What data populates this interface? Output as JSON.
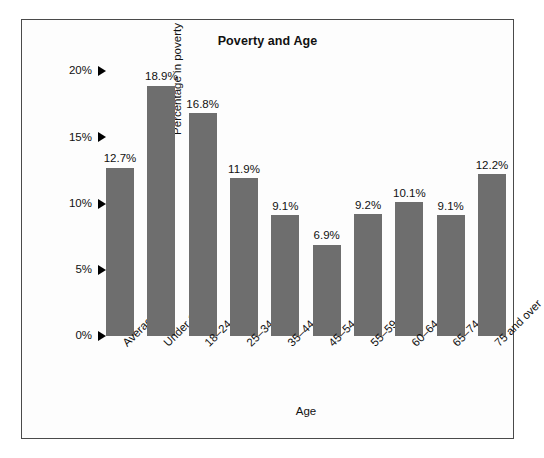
{
  "figure": {
    "title": "Poverty and Age",
    "bar_color": "#6e6e6e",
    "frame_color": "#4a4a4a",
    "background": "#fdfdfd"
  },
  "axes": {
    "x_title": "Age",
    "y_title": "Percentage in poverty",
    "y_ticks": [
      "20%",
      "15%",
      "10%",
      "5%",
      "0%"
    ],
    "y_tick_values": [
      20,
      15,
      10,
      5,
      0
    ],
    "tick_marker": "right-triangle"
  },
  "chart_data": {
    "type": "bar",
    "title": "Poverty and Age",
    "xlabel": "Age",
    "ylabel": "Percentage in poverty",
    "ylim": [
      0,
      20
    ],
    "yticks": [
      0,
      5,
      10,
      15,
      20
    ],
    "ytick_labels": [
      "0%",
      "5%",
      "10%",
      "15%",
      "20%"
    ],
    "grid": false,
    "legend": false,
    "categories": [
      "Average",
      "Under 18",
      "18–24",
      "25–34",
      "35–44",
      "45–54",
      "55–59",
      "60–64",
      "65–74",
      "75 and over"
    ],
    "values": [
      12.7,
      18.9,
      16.8,
      11.9,
      9.1,
      6.9,
      9.2,
      10.1,
      9.1,
      12.2
    ],
    "data_labels": [
      "12.7%",
      "18.9%",
      "16.8%",
      "11.9%",
      "9.1%",
      "6.9%",
      "9.2%",
      "10.1%",
      "9.1%",
      "12.2%"
    ]
  }
}
